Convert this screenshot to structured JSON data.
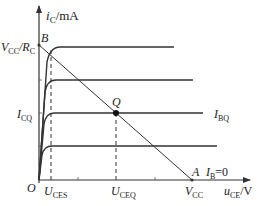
{
  "diagram": {
    "type": "BJT output characteristics with DC load line",
    "axes": {
      "y_label_main": "i",
      "y_label_sub": "C",
      "y_label_unit": "/mA",
      "x_label_main": "u",
      "x_label_sub": "CE",
      "x_label_unit": "/V",
      "origin": "O"
    },
    "labels": {
      "vcc_rc_V": "V",
      "vcc_rc_Vsub": "CC",
      "vcc_rc_slash": "/R",
      "vcc_rc_Rsub": "C",
      "point_b": "B",
      "point_q": "Q",
      "point_a": "A",
      "icq_main": "I",
      "icq_sub": "CQ",
      "ibq_main": "I",
      "ibq_sub": "BQ",
      "ib0_main": "I",
      "ib0_sub": "B",
      "ib0_val": "=0",
      "uces_main": "U",
      "uces_sub": "CES",
      "uceq_main": "U",
      "uceq_sub": "CEQ",
      "vcc_main": "V",
      "vcc_sub": "CC"
    },
    "curves": [
      {
        "name": "IB4",
        "plateau_y": 47,
        "end_x": 174
      },
      {
        "name": "IB3",
        "plateau_y": 80,
        "end_x": 193
      },
      {
        "name": "IBQ",
        "plateau_y": 113,
        "end_x": 203
      },
      {
        "name": "IB1",
        "plateau_y": 146,
        "end_x": 217
      }
    ],
    "colors": {
      "line": "#333333",
      "text": "#222222"
    }
  }
}
